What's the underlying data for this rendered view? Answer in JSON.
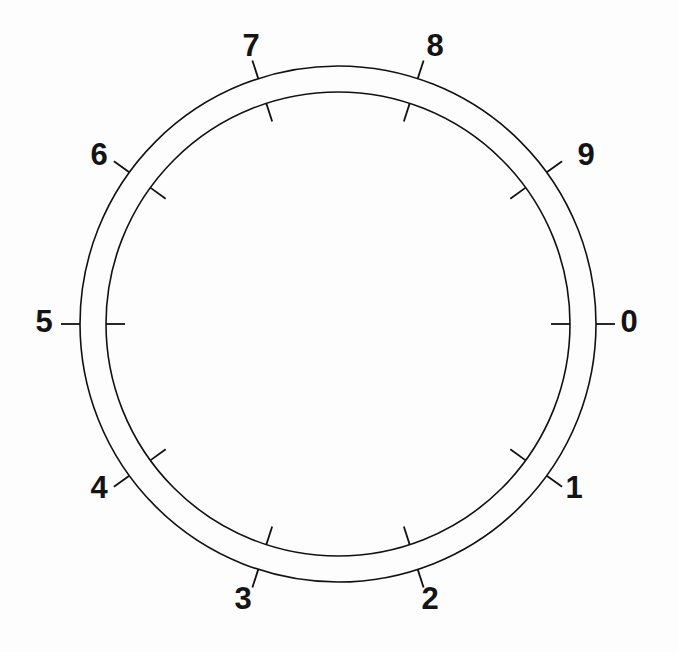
{
  "figure": {
    "name": "numbered-dial-ring",
    "background_color": "#fdfdfd",
    "stroke_color": "#111111",
    "label_color": "#141414",
    "width": 678,
    "height": 652
  },
  "chart_data": {
    "type": "scatter",
    "title": "",
    "subtitle": "",
    "xlabel": "",
    "ylabel": "",
    "grid": false,
    "legend": null,
    "geometry": {
      "center_x": 338,
      "center_y": 324,
      "outer_radius": 258,
      "inner_radius": 232,
      "band_width": 26,
      "circle_stroke_width": 1.6,
      "tick_stroke_width": 1.8,
      "outer_tick_length": 19,
      "inner_tick_length": 19,
      "label_radius": 292,
      "label_font_size": 31,
      "tick_count": 10,
      "angle_step_degrees": 36,
      "start_angle_degrees": 0,
      "direction": "counter-clockwise"
    },
    "categories": [
      "0",
      "1",
      "2",
      "3",
      "4",
      "5",
      "6",
      "7",
      "8",
      "9"
    ],
    "values": [
      0,
      36,
      72,
      108,
      144,
      180,
      216,
      252,
      288,
      324
    ],
    "points": [
      {
        "label": "0",
        "angle_degrees": 0,
        "label_x": 629,
        "label_y": 324
      },
      {
        "label": "1",
        "angle_degrees": 36,
        "label_x": 574,
        "label_y": 490
      },
      {
        "label": "2",
        "angle_degrees": 72,
        "label_x": 430,
        "label_y": 601
      },
      {
        "label": "3",
        "angle_degrees": 108,
        "label_x": 243,
        "label_y": 601
      },
      {
        "label": "4",
        "angle_degrees": 144,
        "label_x": 99,
        "label_y": 490
      },
      {
        "label": "5",
        "angle_degrees": 180,
        "label_x": 44,
        "label_y": 324
      },
      {
        "label": "6",
        "angle_degrees": 216,
        "label_x": 99,
        "label_y": 157
      },
      {
        "label": "7",
        "angle_degrees": 252,
        "label_x": 251,
        "label_y": 48
      },
      {
        "label": "8",
        "angle_degrees": 288,
        "label_x": 435,
        "label_y": 48
      },
      {
        "label": "9",
        "angle_degrees": 324,
        "label_x": 586,
        "label_y": 157
      }
    ]
  }
}
